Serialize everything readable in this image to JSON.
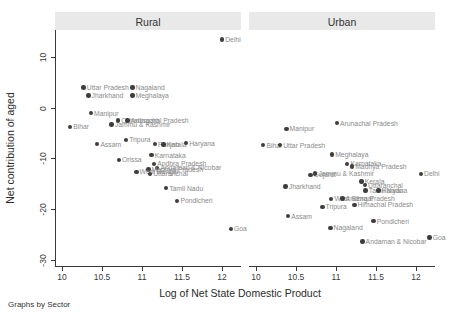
{
  "chart_data": {
    "type": "scatter",
    "title": "",
    "xlabel": "Log of Net State Domestic Product",
    "ylabel": "Net contribution of aged",
    "footnote": "Graphs by Sector",
    "x_ticks": [
      10,
      10.5,
      11,
      11.5,
      12
    ],
    "y_ticks": [
      10,
      0,
      -10,
      -20,
      -30
    ],
    "xlim": [
      9.9125,
      12.2375
    ],
    "ylim": [
      -31.33,
      15.37
    ],
    "grid": false,
    "legend": "none",
    "colors": {
      "marker": "#3d3d3d",
      "point_label": "#8a8a8a",
      "title_band": "#e9e9e9",
      "axis": "#3a3a3a"
    },
    "panels": [
      {
        "title": "Rural",
        "points": [
          {
            "label": "Delhi",
            "x": 12.0,
            "y": 13.5
          },
          {
            "label": "Uttar Pradesh",
            "x": 10.27,
            "y": 4.0
          },
          {
            "label": "Nagaland",
            "x": 10.88,
            "y": 4.0
          },
          {
            "label": "Jharkhand",
            "x": 10.33,
            "y": 2.5
          },
          {
            "label": "Meghalaya",
            "x": 10.88,
            "y": 2.5
          },
          {
            "label": "Manipur",
            "x": 10.36,
            "y": -1.0
          },
          {
            "label": "Bihar",
            "x": 10.1,
            "y": -3.7
          },
          {
            "label": "Chhattisgarh",
            "x": 10.7,
            "y": -2.5
          },
          {
            "label": "Arunachal Pradesh",
            "x": 10.82,
            "y": -2.5
          },
          {
            "label": "Jammu & Kashmir",
            "x": 10.62,
            "y": -3.3
          },
          {
            "label": "Assam",
            "x": 10.44,
            "y": -7.1
          },
          {
            "label": "Tripura",
            "x": 10.8,
            "y": -6.3
          },
          {
            "label": "Punjab",
            "x": 11.16,
            "y": -7.1
          },
          {
            "label": "Kerala",
            "x": 11.27,
            "y": -7.2
          },
          {
            "label": "Haryana",
            "x": 11.55,
            "y": -6.9
          },
          {
            "label": "Orissa",
            "x": 10.71,
            "y": -10.2
          },
          {
            "label": "Karnataka",
            "x": 11.12,
            "y": -9.3
          },
          {
            "label": "Andhra Pradesh",
            "x": 11.15,
            "y": -11.0
          },
          {
            "label": "Andaman & Nicobar",
            "x": 11.19,
            "y": -11.8
          },
          {
            "label": "Madhya Pradesh",
            "x": 11.08,
            "y": -12.1
          },
          {
            "label": "West Bengal",
            "x": 10.93,
            "y": -12.6
          },
          {
            "label": "Uttaranchal",
            "x": 11.1,
            "y": -13.0
          },
          {
            "label": "Tamil Nadu",
            "x": 11.3,
            "y": -15.8
          },
          {
            "label": "Pondicheri",
            "x": 11.44,
            "y": -18.3
          },
          {
            "label": "Goa",
            "x": 12.11,
            "y": -23.8
          }
        ]
      },
      {
        "title": "Urban",
        "points": [
          {
            "label": "Manipur",
            "x": 10.38,
            "y": -4.1
          },
          {
            "label": "Arunachal Pradesh",
            "x": 11.01,
            "y": -3.0
          },
          {
            "label": "Bihar",
            "x": 10.09,
            "y": -7.3
          },
          {
            "label": "Uttar Pradesh",
            "x": 10.3,
            "y": -7.3
          },
          {
            "label": "Meghalaya",
            "x": 10.95,
            "y": -9.2
          },
          {
            "label": "Karnataka",
            "x": 11.14,
            "y": -11.0
          },
          {
            "label": "Madhya Pradesh",
            "x": 11.2,
            "y": -11.5
          },
          {
            "label": "Gujarat",
            "x": 10.68,
            "y": -13.2
          },
          {
            "label": "Jammu & Kashmir",
            "x": 10.74,
            "y": -12.9
          },
          {
            "label": "Delhi",
            "x": 12.06,
            "y": -13.0
          },
          {
            "label": "Jharkhand",
            "x": 10.37,
            "y": -15.5
          },
          {
            "label": "Kerala",
            "x": 11.32,
            "y": -14.5
          },
          {
            "label": "Uttaranchal",
            "x": 11.36,
            "y": -15.2
          },
          {
            "label": "Tamil Nadu",
            "x": 11.37,
            "y": -16.3
          },
          {
            "label": "Haryana",
            "x": 11.53,
            "y": -16.3
          },
          {
            "label": "West Bengal",
            "x": 10.94,
            "y": -17.9
          },
          {
            "label": "Andhra Pradesh",
            "x": 11.08,
            "y": -17.8
          },
          {
            "label": "Tripura",
            "x": 10.83,
            "y": -19.5
          },
          {
            "label": "Himachal Pradesh",
            "x": 11.23,
            "y": -19.1
          },
          {
            "label": "Assam",
            "x": 10.4,
            "y": -21.3
          },
          {
            "label": "Pondicheri",
            "x": 11.47,
            "y": -22.3
          },
          {
            "label": "Nagaland",
            "x": 10.93,
            "y": -23.6
          },
          {
            "label": "Andaman & Nicobar",
            "x": 11.33,
            "y": -26.3
          },
          {
            "label": "Goa",
            "x": 12.17,
            "y": -25.5
          }
        ]
      }
    ]
  }
}
